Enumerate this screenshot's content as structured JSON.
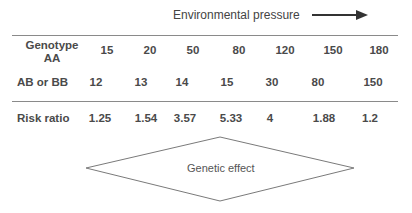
{
  "header": {
    "title": "Environmental pressure",
    "arrow_icon": "right-arrow"
  },
  "table": {
    "rows": [
      {
        "label_line1": "Genotype",
        "label_line2": "AA",
        "values": [
          "15",
          "20",
          "50",
          "80",
          "120",
          "150",
          "180"
        ]
      },
      {
        "label": "AB or BB",
        "values": [
          "12",
          "13",
          "14",
          "15",
          "30",
          "80",
          "150"
        ]
      },
      {
        "label": "Risk ratio",
        "values": [
          "1.25",
          "1.54",
          "3.57",
          "5.33",
          "4",
          "1.88",
          "1.2"
        ]
      }
    ]
  },
  "diamond": {
    "label": "Genetic effect"
  }
}
